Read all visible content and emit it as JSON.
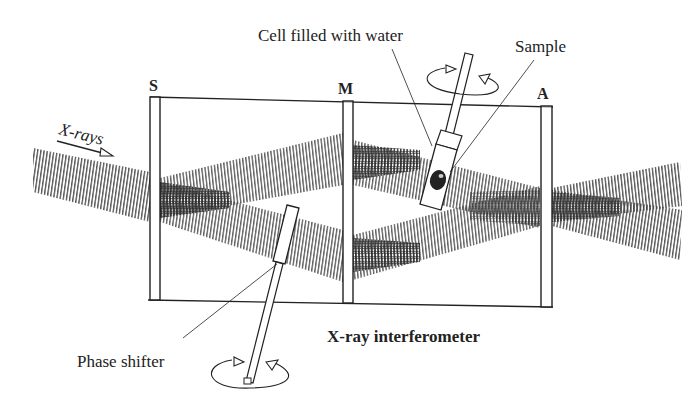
{
  "diagram": {
    "title": "X-ray interferometer",
    "labels": {
      "xrays": "X-rays",
      "crystal_s": "S",
      "crystal_m": "M",
      "crystal_a": "A",
      "cell": "Cell filled with water",
      "sample": "Sample",
      "phase_shifter": "Phase shifter",
      "interferometer": "X-ray interferometer"
    },
    "components": [
      {
        "id": "S",
        "role": "splitter crystal plate"
      },
      {
        "id": "M",
        "role": "mirror crystal plate"
      },
      {
        "id": "A",
        "role": "analyzer crystal plate"
      },
      {
        "id": "cell",
        "role": "cell filled with water containing sample, rotatable"
      },
      {
        "id": "phase_shifter",
        "role": "rotatable phase shifter plate"
      }
    ],
    "colors": {
      "line": "#222222",
      "beam": "#555555",
      "background": "#ffffff"
    }
  }
}
